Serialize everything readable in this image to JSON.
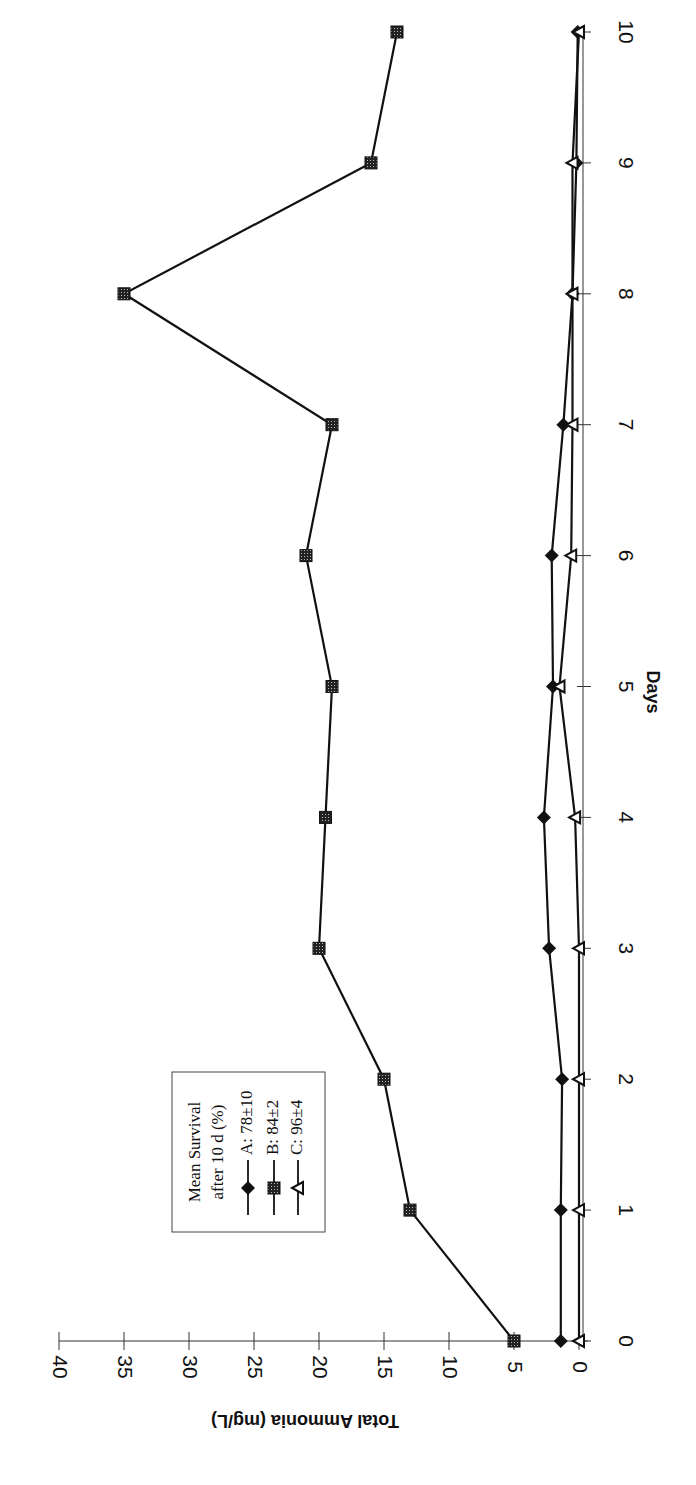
{
  "chart_data": {
    "type": "line",
    "orientation": "rotated-90-clockwise",
    "title": "",
    "xlabel": "Days",
    "ylabel": "Total Ammonia (mg/L)",
    "x": [
      0,
      1,
      2,
      3,
      4,
      5,
      6,
      7,
      8,
      9,
      10
    ],
    "xlim": [
      0,
      10
    ],
    "ylim": [
      0,
      40
    ],
    "x_ticks": [
      "0",
      "1",
      "2",
      "3",
      "4",
      "5",
      "6",
      "7",
      "8",
      "9",
      "10"
    ],
    "y_ticks": [
      "0",
      "5",
      "10",
      "15",
      "20",
      "25",
      "30",
      "35",
      "40"
    ],
    "grid": false,
    "legend": {
      "title_line1": "Mean Survival",
      "title_line2": "after 10 d (%)",
      "position": "upper-left (in unrotated frame)",
      "entries": [
        "A: 78±10",
        "B: 84±2",
        "C: 96±4"
      ]
    },
    "series": [
      {
        "name": "A: 78±10",
        "marker": "diamond-filled",
        "values": [
          1.4,
          1.4,
          1.3,
          2.3,
          2.7,
          2.0,
          2.1,
          1.2,
          0.5,
          0.2,
          0.1
        ]
      },
      {
        "name": "B: 84±2",
        "marker": "square-hatched",
        "values": [
          5,
          13,
          15,
          20,
          19.5,
          19,
          21,
          19,
          35,
          16,
          14
        ]
      },
      {
        "name": "C: 96±4",
        "marker": "triangle-open",
        "values": [
          0,
          0,
          0,
          0,
          0.3,
          1.5,
          0.6,
          0.5,
          0.5,
          0.5,
          0
        ]
      }
    ]
  },
  "colors": {
    "line": "#111111",
    "axis": "#333333",
    "background": "#ffffff"
  }
}
